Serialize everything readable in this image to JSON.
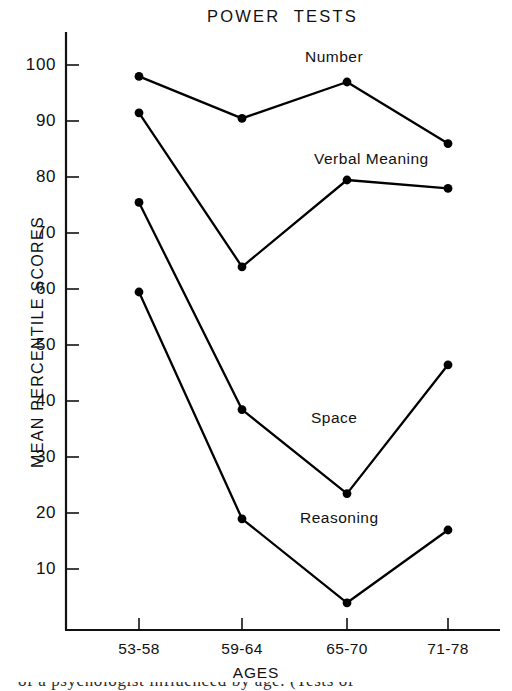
{
  "chart_data": {
    "type": "line",
    "title": "POWER  TESTS",
    "xlabel": "AGES",
    "ylabel": "MEAN PERCENTILE SCORES",
    "categories": [
      "53-58",
      "59-64",
      "65-70",
      "71-78"
    ],
    "xtick_labels": [
      "53-58",
      "59-64",
      "65-70",
      "71-78"
    ],
    "ytick_labels": [
      "100",
      "90",
      "80",
      "70",
      "60",
      "50",
      "40",
      "30",
      "20",
      "10"
    ],
    "yticks": [
      100,
      90,
      80,
      70,
      60,
      50,
      40,
      30,
      20,
      10
    ],
    "ylim": [
      0,
      105
    ],
    "grid": false,
    "legend": "inline-annotations",
    "marker": "filled-circle",
    "line_color": "#000000",
    "series": [
      {
        "name": "Number",
        "values": [
          98.5,
          91.0,
          97.5,
          86.5
        ]
      },
      {
        "name": "Verbal Meaning",
        "values": [
          92.0,
          64.5,
          80.0,
          78.5
        ]
      },
      {
        "name": "Space",
        "values": [
          76.0,
          39.0,
          24.0,
          47.0
        ]
      },
      {
        "name": "Reasoning",
        "values": [
          60.0,
          19.5,
          4.5,
          17.5
        ]
      }
    ],
    "annotations": [
      {
        "text": "Number",
        "x": 3.0,
        "y": 104
      },
      {
        "text": "Verbal Meaning",
        "x": 3.1,
        "y": 86
      },
      {
        "text": "Space",
        "x": 2.45,
        "y": 39
      },
      {
        "text": "Reasoning",
        "x": 2.2,
        "y": 21
      }
    ]
  },
  "figure": {
    "bottom_text_fragment": "of a psychologist influenced by age. (Tests of"
  }
}
